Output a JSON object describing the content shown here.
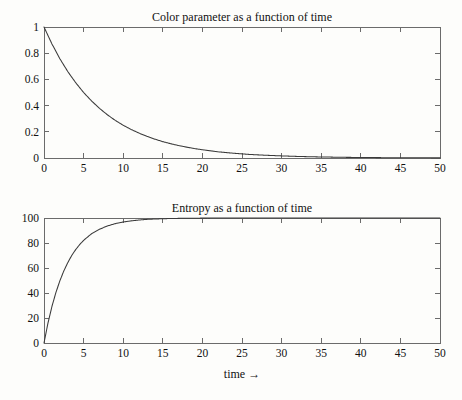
{
  "figure": {
    "background_color": "#fdfdfb",
    "axis_color": "#6b6b6b",
    "curve_color": "#3a3a3a",
    "text_color": "#111111",
    "xlabel": "time →"
  },
  "chart_data": [
    {
      "type": "line",
      "title": "Color parameter as a function of time",
      "xlabel": "",
      "ylabel": "",
      "xlim": [
        0,
        50
      ],
      "ylim": [
        0,
        1
      ],
      "grid": false,
      "legend": null,
      "xticks": [
        0,
        5,
        10,
        15,
        20,
        25,
        30,
        35,
        40,
        45,
        50
      ],
      "xticklabels": [
        "0",
        "5",
        "10",
        "15",
        "20",
        "25",
        "30",
        "35",
        "40",
        "45",
        "50"
      ],
      "yticks": [
        0,
        0.2,
        0.4,
        0.6,
        0.8,
        1
      ],
      "yticklabels": [
        "0",
        "0.2",
        "0.4",
        "0.6",
        "0.8",
        "1"
      ],
      "series": [
        {
          "name": "color parameter",
          "description": "exponential decay exp(-t/7.2), 1 at t=0 decaying to ~0 by t=50",
          "x": [
            0,
            1,
            2,
            3,
            4,
            5,
            6,
            7,
            8,
            9,
            10,
            11,
            12,
            13,
            14,
            15,
            16,
            17,
            18,
            19,
            20,
            22,
            24,
            26,
            28,
            30,
            32,
            34,
            36,
            38,
            40,
            42,
            44,
            46,
            48,
            50
          ],
          "y": [
            1.0,
            0.871,
            0.758,
            0.66,
            0.575,
            0.5,
            0.436,
            0.379,
            0.33,
            0.287,
            0.25,
            0.218,
            0.19,
            0.165,
            0.144,
            0.125,
            0.109,
            0.095,
            0.083,
            0.072,
            0.063,
            0.047,
            0.036,
            0.027,
            0.021,
            0.016,
            0.012,
            0.009,
            0.007,
            0.005,
            0.004,
            0.003,
            0.002,
            0.0017,
            0.0013,
            0.001
          ]
        }
      ]
    },
    {
      "type": "line",
      "title": "Entropy as a function of time",
      "xlabel": "time →",
      "ylabel": "",
      "xlim": [
        0,
        50
      ],
      "ylim": [
        0,
        100
      ],
      "grid": false,
      "legend": null,
      "xticks": [
        0,
        5,
        10,
        15,
        20,
        25,
        30,
        35,
        40,
        45,
        50
      ],
      "xticklabels": [
        "0",
        "5",
        "10",
        "15",
        "20",
        "25",
        "30",
        "35",
        "40",
        "45",
        "50"
      ],
      "yticks": [
        0,
        20,
        40,
        60,
        80,
        100
      ],
      "yticklabels": [
        "0",
        "20",
        "40",
        "60",
        "80",
        "100"
      ],
      "series": [
        {
          "name": "entropy",
          "description": "saturating exponential rise 100*(1-exp(-t/2.9)) approaching 100",
          "x": [
            0,
            0.5,
            1,
            1.5,
            2,
            2.5,
            3,
            3.5,
            4,
            4.5,
            5,
            6,
            7,
            8,
            9,
            10,
            11,
            12,
            13,
            14,
            15,
            16,
            18,
            20,
            22,
            25,
            30,
            35,
            40,
            45,
            50
          ],
          "y": [
            0,
            15.9,
            29.2,
            40.3,
            49.7,
            57.6,
            64.3,
            70.0,
            74.7,
            78.7,
            82.1,
            87.4,
            91.0,
            93.6,
            95.5,
            96.8,
            97.7,
            98.4,
            98.9,
            99.2,
            99.4,
            99.6,
            99.8,
            99.9,
            99.95,
            99.98,
            100.0,
            100.0,
            100.0,
            100.0,
            100.0
          ]
        }
      ]
    }
  ]
}
